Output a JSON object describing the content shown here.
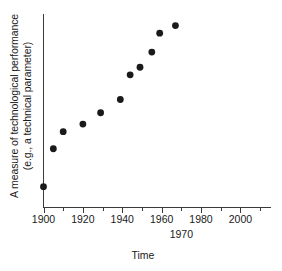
{
  "chart_data": {
    "type": "scatter",
    "title": "",
    "xlabel": "Time",
    "ylabel": "A measure of technological performance (e.g., a technical parameter)",
    "ylabel_lines": [
      "A measure of technological performance",
      "(e.g., a technical parameter)"
    ],
    "grid": false,
    "legend": null,
    "legend_position": "none",
    "xlim": [
      1900,
      2014
    ],
    "ylim": [
      0,
      100
    ],
    "x_major_ticks": [
      1900,
      1920,
      1940,
      1960,
      1980,
      2000
    ],
    "x_minor_ticks": [
      1910,
      1930,
      1950,
      1970,
      1990,
      2010
    ],
    "x_tick_labels": [
      "1900",
      "1920",
      "1940",
      "1960",
      "1980",
      "2000"
    ],
    "y_ticks": [],
    "y_tick_labels": [],
    "annotations": [
      {
        "text": "1970",
        "x": 1970,
        "row": 2
      }
    ],
    "series": [
      {
        "name": "Technological performance",
        "marker": "filled-circle",
        "marker_color": "#1a1a1a",
        "x": [
          1900,
          1905,
          1910,
          1920,
          1929,
          1939,
          1944,
          1949,
          1955,
          1959,
          1967
        ],
        "y": [
          11,
          31,
          40,
          44,
          50,
          57,
          70,
          74,
          82,
          92,
          96
        ]
      }
    ]
  },
  "axes": {
    "x_axis_name": "time-axis",
    "y_axis_name": "performance-axis"
  }
}
